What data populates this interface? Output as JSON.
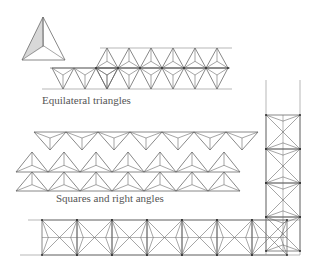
{
  "captions": {
    "equilateral": "Equilateral triangles",
    "squares": "Squares and right angles"
  },
  "colors": {
    "stroke": "#6a6a6a",
    "guide": "#9a9a9a",
    "shade": "#d8d8d8",
    "node": "#333333"
  },
  "figures": {
    "single_triangle": {
      "apex": [
        43,
        17
      ],
      "left": [
        22,
        60
      ],
      "right": [
        65,
        60
      ],
      "center": [
        43,
        47
      ]
    },
    "equilateral_band": {
      "top_line_y": 48,
      "mid_line_y": 68,
      "bottom_line_y": 89,
      "down_triangles": 3,
      "diamonds": 6
    },
    "right_angle_band": {
      "rows": 3,
      "top_row_y": [
        132,
        152
      ],
      "mid_row_y": [
        152,
        172
      ],
      "bottom_row_y": [
        172,
        191
      ]
    },
    "square_band": {
      "y_top": 220,
      "y_bottom": 255,
      "x_start": 42,
      "cell": 34,
      "cells": 7
    },
    "vertical_column": {
      "x_left": 266,
      "x_right": 300,
      "y_top": 115,
      "cells": 4
    }
  }
}
